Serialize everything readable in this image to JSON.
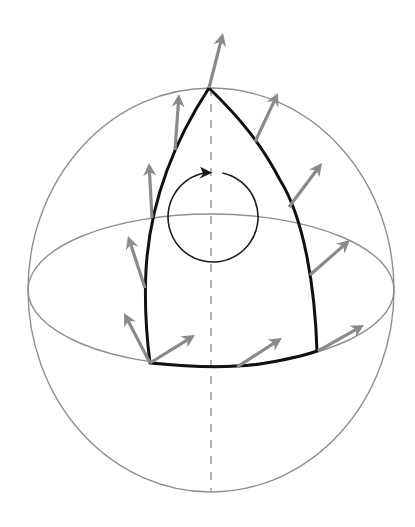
{
  "figure": {
    "width": 415,
    "height": 527,
    "colors": {
      "sphere": "#8f8f8f",
      "axis": "#9a9a9a",
      "triangle": "#111111",
      "vectors": "#8a8a8a",
      "rotation_indicator": "#1a1a1a",
      "background": "#ffffff"
    },
    "sphere": {
      "cx": 211,
      "cy": 290,
      "rx": 183,
      "ry": 202
    },
    "equator": {
      "cx": 211,
      "cy": 290,
      "rx": 183,
      "ry": 76
    },
    "axis": {
      "x": 211,
      "y1": 88,
      "y2": 492,
      "style": "dashed"
    },
    "triangle": {
      "vertices": [
        {
          "name": "north-pole",
          "x": 209,
          "y": 88
        },
        {
          "name": "bottom-left",
          "x": 150,
          "y": 363
        },
        {
          "name": "bottom-right",
          "x": 317,
          "y": 351
        }
      ]
    },
    "rotation_indicator": {
      "cx": 213,
      "cy": 217,
      "r": 45,
      "direction": "clockwise"
    },
    "vectors": [
      {
        "name": "vector-pole",
        "x1": 209,
        "y1": 88,
        "x2": 223,
        "y2": 33
      },
      {
        "name": "vector-left-1",
        "x1": 175,
        "y1": 150,
        "x2": 179,
        "y2": 94
      },
      {
        "name": "vector-left-2",
        "x1": 152,
        "y1": 218,
        "x2": 149,
        "y2": 163
      },
      {
        "name": "vector-left-3",
        "x1": 145,
        "y1": 288,
        "x2": 128,
        "y2": 236
      },
      {
        "name": "vector-left-4",
        "x1": 150,
        "y1": 363,
        "x2": 124,
        "y2": 313
      },
      {
        "name": "vector-bottom-1",
        "x1": 150,
        "y1": 363,
        "x2": 195,
        "y2": 335
      },
      {
        "name": "vector-bottom-2",
        "x1": 237,
        "y1": 367,
        "x2": 282,
        "y2": 338
      },
      {
        "name": "vector-bottom-3",
        "x1": 318,
        "y1": 351,
        "x2": 364,
        "y2": 325
      },
      {
        "name": "vector-right-1",
        "x1": 310,
        "y1": 275,
        "x2": 350,
        "y2": 240
      },
      {
        "name": "vector-right-2",
        "x1": 289,
        "y1": 207,
        "x2": 322,
        "y2": 163
      },
      {
        "name": "vector-right-3",
        "x1": 255,
        "y1": 142,
        "x2": 278,
        "y2": 93
      }
    ]
  }
}
